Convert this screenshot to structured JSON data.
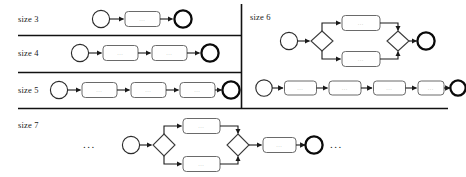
{
  "figure": {
    "kind": "process-model-size-examples",
    "background": "#ffffff",
    "line_color": "#1a1a1a",
    "node_fill": "#ffffff",
    "node_stroke": "#555555",
    "activity_label": "...",
    "ellipsis": "...",
    "rows": [
      {
        "label": "size 3",
        "column": "left",
        "elements": [
          "start-event",
          "activity",
          "end-event"
        ]
      },
      {
        "label": "size 4",
        "column": "left",
        "elements": [
          "start-event",
          "activity",
          "activity",
          "end-event"
        ]
      },
      {
        "label": "size 5",
        "column": "left",
        "elements": [
          "start-event",
          "activity",
          "activity",
          "activity",
          "end-event"
        ]
      },
      {
        "label": "size 6",
        "column": "right",
        "variants": [
          {
            "elements": [
              "start-event",
              "gateway-split",
              "activity",
              "activity",
              "gateway-join",
              "end-event"
            ]
          },
          {
            "elements": [
              "start-event",
              "activity",
              "activity",
              "activity",
              "activity",
              "end-event"
            ]
          }
        ]
      },
      {
        "label": "size 7",
        "column": "bottom",
        "leading_ellipsis": "...",
        "trailing_ellipsis": "...",
        "elements": [
          "start-event",
          "gateway-split",
          "activity",
          "activity",
          "gateway-join",
          "activity",
          "end-event"
        ]
      }
    ],
    "dividers": [
      {
        "orientation": "horizontal",
        "y": 35
      },
      {
        "orientation": "horizontal",
        "y": 72
      },
      {
        "orientation": "horizontal",
        "y": 108
      },
      {
        "orientation": "vertical",
        "x": 241
      }
    ]
  }
}
